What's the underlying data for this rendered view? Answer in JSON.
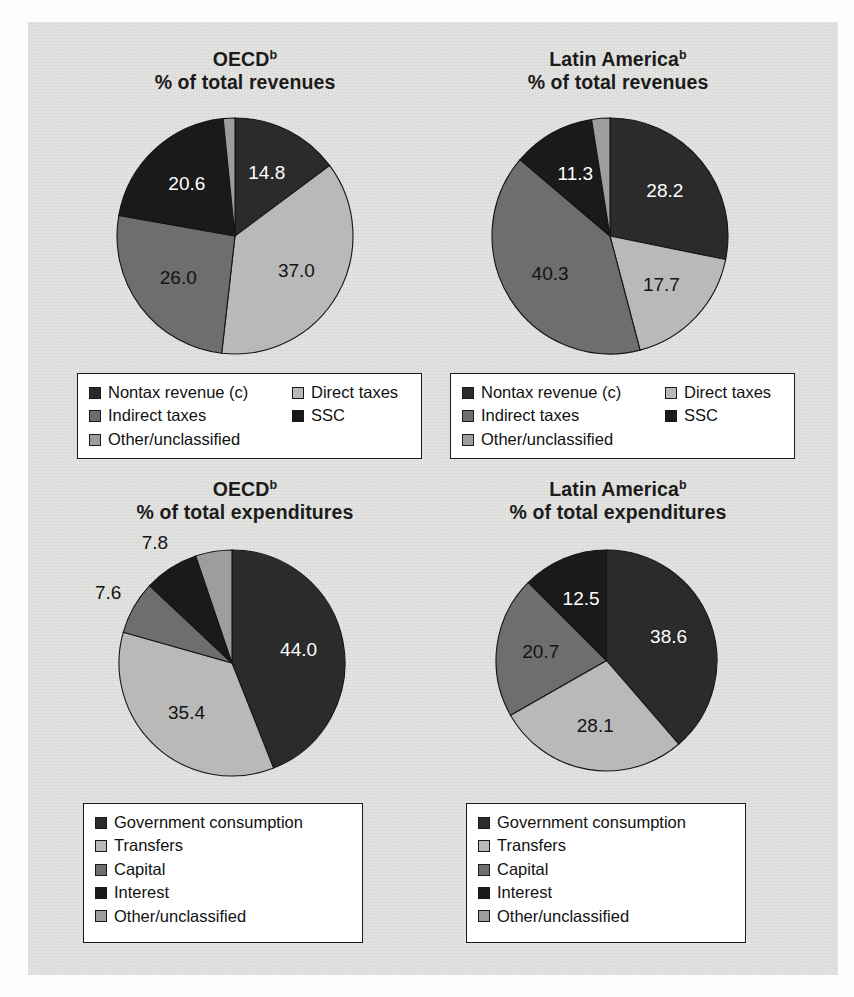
{
  "colors": {
    "panel_bg": "#e3e3e1",
    "legend_bg": "#ffffff",
    "outline": "#1a1a1a",
    "nontax_revenue": "#2b2b2b",
    "direct_taxes": "#b9b9b9",
    "indirect_taxes": "#6e6e6e",
    "ssc": "#1a1a1a",
    "other_unclassified": "#9d9d9d",
    "government_consumption": "#2b2b2b",
    "transfers": "#b9b9b9",
    "capital": "#6e6e6e",
    "interest": "#1a1a1a"
  },
  "revenue_legend": {
    "col1": [
      {
        "label": "Nontax revenue (c)",
        "color": "#2b2b2b",
        "swatch": "nontax-revenue-swatch"
      },
      {
        "label": "Indirect taxes",
        "color": "#6e6e6e",
        "swatch": "indirect-taxes-swatch"
      },
      {
        "label": "Other/unclassified",
        "color": "#9d9d9d",
        "swatch": "other-unclassified-swatch"
      }
    ],
    "col2": [
      {
        "label": "Direct taxes",
        "color": "#b9b9b9",
        "swatch": "direct-taxes-swatch"
      },
      {
        "label": "SSC",
        "color": "#1a1a1a",
        "swatch": "ssc-swatch"
      }
    ]
  },
  "expenditure_legend": {
    "col1": [
      {
        "label": "Government consumption",
        "color": "#2b2b2b",
        "swatch": "government-consumption-swatch"
      },
      {
        "label": "Transfers",
        "color": "#b9b9b9",
        "swatch": "transfers-swatch"
      },
      {
        "label": "Capital",
        "color": "#6e6e6e",
        "swatch": "capital-swatch"
      },
      {
        "label": "Interest",
        "color": "#1a1a1a",
        "swatch": "interest-swatch"
      },
      {
        "label": "Other/unclassified",
        "color": "#9d9d9d",
        "swatch": "other-unclassified-swatch"
      }
    ],
    "col2": []
  },
  "chart_data": [
    {
      "id": "oecd-revenues",
      "type": "pie",
      "title": "OECD",
      "title_superscript": "b",
      "subtitle": "% of total revenues",
      "start_angle_deg": 0,
      "direction": "clockwise",
      "categories": [
        "Nontax revenue (c)",
        "Direct taxes",
        "Indirect taxes",
        "SSC",
        "Other/unclassified"
      ],
      "values": [
        14.8,
        37.0,
        26.0,
        20.6,
        1.6
      ],
      "labels_shown": [
        "14.8",
        "37.0",
        "26.0",
        "20.6",
        ""
      ],
      "colors": [
        "#2b2b2b",
        "#b9b9b9",
        "#6e6e6e",
        "#1a1a1a",
        "#9d9d9d"
      ],
      "label_colors": [
        "light",
        "dark",
        "dark",
        "light",
        "dark"
      ]
    },
    {
      "id": "latin-america-revenues",
      "type": "pie",
      "title": "Latin America",
      "title_superscript": "b",
      "subtitle": "% of total revenues",
      "start_angle_deg": 0,
      "direction": "clockwise",
      "categories": [
        "Nontax revenue (c)",
        "Direct taxes",
        "Indirect taxes",
        "SSC",
        "Other/unclassified"
      ],
      "values": [
        28.2,
        17.7,
        40.3,
        11.3,
        2.5
      ],
      "labels_shown": [
        "28.2",
        "17.7",
        "40.3",
        "11.3",
        ""
      ],
      "colors": [
        "#2b2b2b",
        "#b9b9b9",
        "#6e6e6e",
        "#1a1a1a",
        "#9d9d9d"
      ],
      "label_colors": [
        "light",
        "dark",
        "dark",
        "light",
        "dark"
      ]
    },
    {
      "id": "oecd-expenditures",
      "type": "pie",
      "title": "OECD",
      "title_superscript": "b",
      "subtitle": "% of total expenditures",
      "start_angle_deg": 0,
      "direction": "clockwise",
      "categories": [
        "Government consumption",
        "Transfers",
        "Capital",
        "Interest",
        "Other/unclassified"
      ],
      "values": [
        44.0,
        35.4,
        7.6,
        7.8,
        5.2
      ],
      "labels_shown": [
        "44.0",
        "35.4",
        "7.6",
        "7.8",
        ""
      ],
      "colors": [
        "#2b2b2b",
        "#b9b9b9",
        "#6e6e6e",
        "#1a1a1a",
        "#9d9d9d"
      ],
      "label_colors": [
        "light",
        "dark",
        "dark",
        "dark",
        "dark"
      ]
    },
    {
      "id": "latin-america-expenditures",
      "type": "pie",
      "title": "Latin America",
      "title_superscript": "b",
      "subtitle": "% of total expenditures",
      "start_angle_deg": 0,
      "direction": "clockwise",
      "categories": [
        "Government consumption",
        "Transfers",
        "Capital",
        "Interest"
      ],
      "values": [
        38.6,
        28.1,
        20.7,
        12.5
      ],
      "labels_shown": [
        "38.6",
        "28.1",
        "20.7",
        "12.5"
      ],
      "colors": [
        "#2b2b2b",
        "#b9b9b9",
        "#6e6e6e",
        "#1a1a1a"
      ],
      "label_colors": [
        "light",
        "dark",
        "dark",
        "light"
      ]
    }
  ]
}
